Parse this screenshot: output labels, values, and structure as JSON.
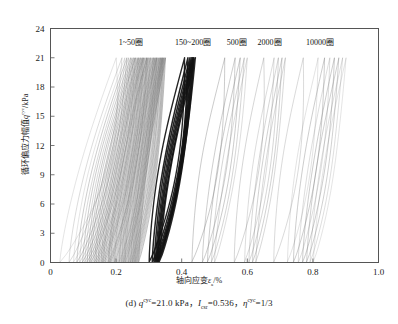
{
  "figure": {
    "panel_id": "(d)",
    "caption_parts": {
      "prefix": "(d)",
      "q_symbol": "q",
      "q_sup": "cyc",
      "q_eq": "=21.0 kPa",
      "sep1": "，",
      "icsr_symbol": "I",
      "icsr_sub": "csr",
      "icsr_eq": "=0.536",
      "sep2": "，",
      "eta_symbol": "η",
      "eta_sup": "cyc",
      "eta_eq": "=1/3"
    },
    "caption_plain": "(d) q^cyc=21.0 kPa，I_csr=0.536，η^cyc=1/3"
  },
  "axes": {
    "x": {
      "label_cn": "轴向应变",
      "label_symbol": "ε",
      "label_sub": "a",
      "label_unit": "/%",
      "label_plain": "轴向应变 εa/%",
      "ticks": [
        "0",
        "0.2",
        "0.4",
        "0.6",
        "0.8",
        "1.0"
      ],
      "min": 0,
      "max": 1.0
    },
    "y": {
      "label_cn": "循环偏应力幅值",
      "label_symbol": "q",
      "label_sup": "cyc",
      "label_unit": "/kPa",
      "label_plain": "循环偏应力幅值 q^cyc/kPa",
      "ticks": [
        "0",
        "3",
        "6",
        "9",
        "12",
        "15",
        "18",
        "21",
        "24"
      ],
      "min": 0,
      "max": 24
    }
  },
  "annotations": [
    {
      "text": "1~50圈",
      "x_data": 0.245,
      "y_data": 22.3
    },
    {
      "text": "150~200圈",
      "x_data": 0.435,
      "y_data": 22.3
    },
    {
      "text": "500圈",
      "x_data": 0.568,
      "y_data": 22.3
    },
    {
      "text": "2000圈",
      "x_data": 0.668,
      "y_data": 22.3
    },
    {
      "text": "10000圈",
      "x_data": 0.822,
      "y_data": 22.3
    }
  ],
  "chart_data": {
    "type": "line",
    "title": "",
    "xlabel": "轴向应变 εa/%",
    "ylabel": "循环偏应力幅值 q^cyc/kPa",
    "xlim": [
      0,
      1.0
    ],
    "ylim": [
      0,
      24
    ],
    "xticks": [
      0,
      0.2,
      0.4,
      0.6,
      0.8,
      1.0
    ],
    "yticks": [
      0,
      3,
      6,
      9,
      12,
      15,
      18,
      21,
      24
    ],
    "grid": false,
    "legend": "inline annotations at top of plot",
    "loop_peak_q": 21.0,
    "loop_base_q": 0.0,
    "groups": [
      {
        "name": "1~50圈",
        "cycles": "1 to 50",
        "n_loops": 50,
        "line_weight": "thin",
        "shade": "#6a6a6a",
        "strain_bottom_start": 0.028,
        "strain_bottom_end": 0.268,
        "strain_top_start": 0.2,
        "strain_top_end": 0.35,
        "first_loop_open": true
      },
      {
        "name": "150~200圈",
        "cycles": "150 to 200",
        "n_loops": 8,
        "line_weight": "thick",
        "shade": "#111111",
        "strain_bottom_start": 0.3,
        "strain_bottom_end": 0.33,
        "strain_top_start": 0.408,
        "strain_top_end": 0.44
      },
      {
        "name": "500圈",
        "cycles": "500",
        "n_loops": 5,
        "line_weight": "thin",
        "shade": "#777777",
        "strain_bottom_start": 0.43,
        "strain_bottom_end": 0.5,
        "strain_top_start": 0.53,
        "strain_top_end": 0.6
      },
      {
        "name": "2000圈",
        "cycles": "2000",
        "n_loops": 5,
        "line_weight": "thin",
        "shade": "#777777",
        "strain_bottom_start": 0.56,
        "strain_bottom_end": 0.625,
        "strain_top_start": 0.65
      },
      {
        "name": "10000圈",
        "cycles": "10000",
        "n_loops": 8,
        "line_weight": "thin",
        "shade": "#777777",
        "strain_bottom_start": 0.68,
        "strain_bottom_end": 0.8,
        "strain_top_start": 0.77,
        "strain_top_end": 0.9
      }
    ]
  }
}
